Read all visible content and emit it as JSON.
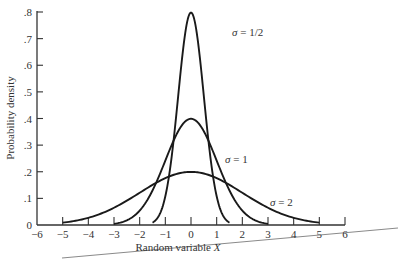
{
  "chart_data": {
    "type": "line",
    "title": "",
    "xlabel": "Random variable X",
    "ylabel": "Probability density",
    "xlim": [
      -6,
      6
    ],
    "ylim": [
      0,
      0.8
    ],
    "grid": false,
    "legend_position": "inline labels",
    "x_ticks": [
      -6,
      -5,
      -4,
      -3,
      -2,
      -1,
      0,
      1,
      2,
      3,
      4,
      5,
      6
    ],
    "x_tick_labels": [
      "−6",
      "−5",
      "−4",
      "−3",
      "−2",
      "−1",
      "0",
      "1",
      "2",
      "3",
      "4",
      "5",
      "6"
    ],
    "y_ticks": [
      0,
      0.1,
      0.2,
      0.3,
      0.4,
      0.5,
      0.6,
      0.7,
      0.8
    ],
    "y_tick_labels": [
      "0",
      ".1",
      ".2",
      ".3",
      ".4",
      ".5",
      ".6",
      ".7",
      ".8"
    ],
    "series": [
      {
        "name": "σ = 1/2",
        "sigma": 0.5,
        "mean": 0,
        "x_range": [
          -1.5,
          1.5
        ],
        "peak": 0.798,
        "x": [
          -1.5,
          -1.0,
          -0.5,
          0,
          0.5,
          1.0,
          1.5
        ],
        "values": [
          0.009,
          0.108,
          0.484,
          0.798,
          0.484,
          0.108,
          0.009
        ]
      },
      {
        "name": "σ = 1",
        "sigma": 1,
        "mean": 0,
        "x_range": [
          -3,
          3
        ],
        "peak": 0.399,
        "x": [
          -3,
          -2,
          -1,
          0,
          1,
          2,
          3
        ],
        "values": [
          0.004,
          0.054,
          0.242,
          0.399,
          0.242,
          0.054,
          0.004
        ]
      },
      {
        "name": "σ = 2",
        "sigma": 2,
        "mean": 0,
        "x_range": [
          -5,
          5
        ],
        "peak": 0.199,
        "x": [
          -5,
          -4,
          -3,
          -2,
          -1,
          0,
          1,
          2,
          3,
          4,
          5
        ],
        "values": [
          0.009,
          0.027,
          0.065,
          0.121,
          0.176,
          0.199,
          0.176,
          0.121,
          0.065,
          0.027,
          0.009
        ]
      }
    ],
    "annotations": [
      {
        "text": "σ = 1/2",
        "near_x": 0.9,
        "near_y": 0.72
      },
      {
        "text": "σ = 1",
        "near_x": 1.1,
        "near_y": 0.31
      },
      {
        "text": "σ = 2",
        "near_x": 3.0,
        "near_y": 0.105
      }
    ]
  },
  "labels": {
    "sigma_half": {
      "sym": "σ",
      "rest": " = 1/2"
    },
    "sigma_one": {
      "sym": "σ",
      "rest": " = 1"
    },
    "sigma_two": {
      "sym": "σ",
      "rest": " = 2"
    }
  },
  "axes": {
    "x_title": "Random variable X",
    "y_title": "Probability density"
  },
  "colors": {
    "curve": "#1a1a1a",
    "axis": "#333333",
    "background": "#ffffff",
    "artifact_line": "#8a8a8a"
  }
}
